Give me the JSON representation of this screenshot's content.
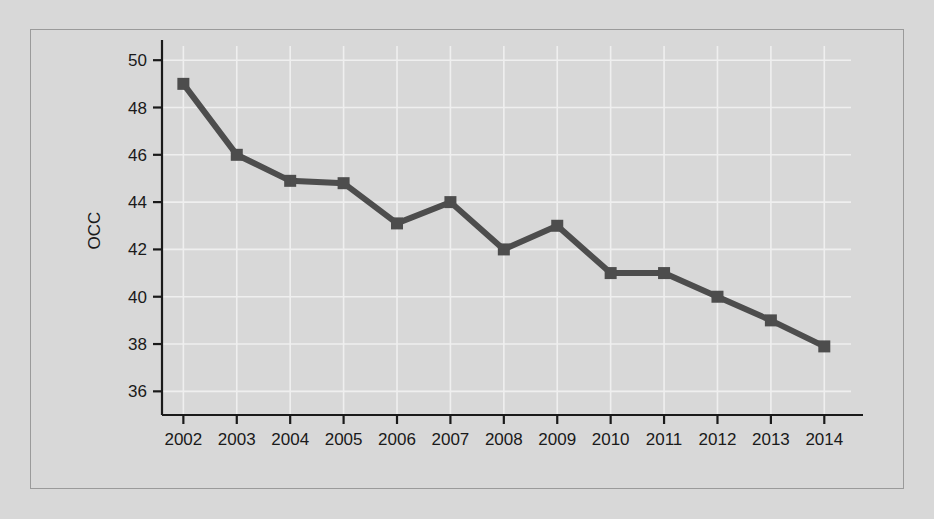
{
  "figure": {
    "background_color": "#d8d8d8",
    "frame_border_color": "#9a9a9a",
    "gridline_color": "#efefef",
    "axis_color": "#1a1a1a",
    "series_color": "#4d4d4d"
  },
  "chart_data": {
    "type": "line",
    "title": "",
    "subtitle": "",
    "xlabel": "",
    "ylabel": "OCC",
    "categories": [
      "2002",
      "2003",
      "2004",
      "2005",
      "2006",
      "2007",
      "2008",
      "2009",
      "2010",
      "2011",
      "2012",
      "2013",
      "2014"
    ],
    "x": [
      2002,
      2003,
      2004,
      2005,
      2006,
      2007,
      2008,
      2009,
      2010,
      2011,
      2012,
      2013,
      2014
    ],
    "values": [
      49.0,
      46.0,
      44.9,
      44.8,
      43.1,
      44.0,
      42.0,
      43.0,
      41.0,
      41.0,
      40.0,
      39.0,
      37.9
    ],
    "series": [
      {
        "name": "OCC",
        "values": [
          49.0,
          46.0,
          44.9,
          44.8,
          43.1,
          44.0,
          42.0,
          43.0,
          41.0,
          41.0,
          40.0,
          39.0,
          37.9
        ],
        "color": "#4d4d4d",
        "marker": "square",
        "line_width": 6
      }
    ],
    "ylim": [
      35.0,
      50.6
    ],
    "xlim": [
      2001.6,
      2014.5
    ],
    "yticks": [
      36,
      38,
      40,
      42,
      44,
      46,
      48,
      50
    ],
    "ytick_labels": [
      "36",
      "38",
      "40",
      "42",
      "44",
      "46",
      "48",
      "50"
    ],
    "xticks": [
      2002,
      2003,
      2004,
      2005,
      2006,
      2007,
      2008,
      2009,
      2010,
      2011,
      2012,
      2013,
      2014
    ],
    "xtick_labels": [
      "2002",
      "2003",
      "2004",
      "2005",
      "2006",
      "2007",
      "2008",
      "2009",
      "2010",
      "2011",
      "2012",
      "2013",
      "2014"
    ],
    "grid": true,
    "grid_axis": "both",
    "legend": false,
    "legend_position": "none",
    "annotations": []
  }
}
